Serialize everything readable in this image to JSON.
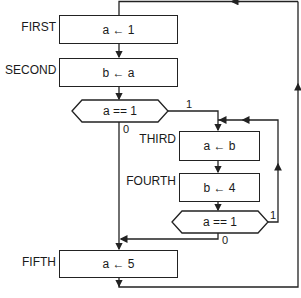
{
  "diagram": {
    "type": "flowchart",
    "nodes": [
      {
        "id": "first",
        "label": "FIRST",
        "kind": "process",
        "text": "a ← 1"
      },
      {
        "id": "second",
        "label": "SECOND",
        "kind": "process",
        "text": "b ← a"
      },
      {
        "id": "cond1",
        "label": "",
        "kind": "decision",
        "text": "a == 1"
      },
      {
        "id": "third",
        "label": "THIRD",
        "kind": "process",
        "text": "a ← b"
      },
      {
        "id": "fourth",
        "label": "FOURTH",
        "kind": "process",
        "text": "b ← 4"
      },
      {
        "id": "cond2",
        "label": "",
        "kind": "decision",
        "text": "a == 1"
      },
      {
        "id": "fifth",
        "label": "FIFTH",
        "kind": "process",
        "text": "a ← 5"
      }
    ],
    "edges": [
      {
        "from": "first",
        "to": "second",
        "label": ""
      },
      {
        "from": "second",
        "to": "cond1",
        "label": ""
      },
      {
        "from": "cond1",
        "to": "third",
        "label": "1"
      },
      {
        "from": "cond1",
        "to": "fifth",
        "label": "0"
      },
      {
        "from": "third",
        "to": "fourth",
        "label": ""
      },
      {
        "from": "fourth",
        "to": "cond2",
        "label": ""
      },
      {
        "from": "cond2",
        "to": "third",
        "label": "1"
      },
      {
        "from": "cond2",
        "to": "fifth",
        "label": "0"
      },
      {
        "from": "fifth",
        "to": "first",
        "label": ""
      }
    ],
    "labels": {
      "first": "FIRST",
      "second": "SECOND",
      "third": "THIRD",
      "fourth": "FOURTH",
      "fifth": "FIFTH"
    },
    "texts": {
      "first": "a ← 1",
      "second": "b ← a",
      "cond1": "a == 1",
      "third": "a ← b",
      "fourth": "b ← 4",
      "cond2": "a == 1",
      "fifth": "a ← 5"
    },
    "branch_labels": {
      "cond1_true": "1",
      "cond1_false": "0",
      "cond2_true": "1",
      "cond2_false": "0"
    }
  }
}
